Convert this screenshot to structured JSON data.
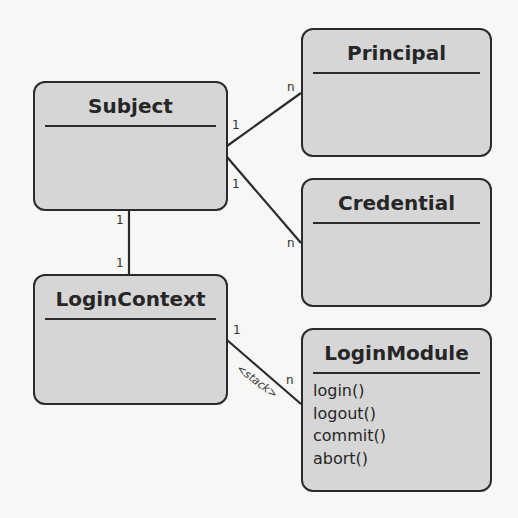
{
  "diagram": {
    "type": "UML class diagram",
    "classes": [
      {
        "id": "subject",
        "name": "Subject",
        "methods": []
      },
      {
        "id": "principal",
        "name": "Principal",
        "methods": []
      },
      {
        "id": "credential",
        "name": "Credential",
        "methods": []
      },
      {
        "id": "login_context",
        "name": "LoginContext",
        "methods": []
      },
      {
        "id": "login_module",
        "name": "LoginModule",
        "methods": [
          "login()",
          "logout()",
          "commit()",
          "abort()"
        ]
      }
    ],
    "associations": [
      {
        "from": "Subject",
        "to": "Principal",
        "from_mult": "1",
        "to_mult": "n"
      },
      {
        "from": "Subject",
        "to": "Credential",
        "from_mult": "1",
        "to_mult": "n"
      },
      {
        "from": "Subject",
        "to": "LoginContext",
        "from_mult": "1",
        "to_mult": "1"
      },
      {
        "from": "LoginContext",
        "to": "LoginModule",
        "from_mult": "1",
        "to_mult": "n",
        "label": "<stack>"
      }
    ]
  },
  "labels": {
    "subject": "Subject",
    "principal": "Principal",
    "credential": "Credential",
    "login_context": "LoginContext",
    "login_module": "LoginModule",
    "m_login": "login()",
    "m_logout": "logout()",
    "m_commit": "commit()",
    "m_abort": "abort()",
    "one": "1",
    "many": "n",
    "stack": "<stack>"
  },
  "colors": {
    "box_fill": "#d6d6d6",
    "stroke": "#2b2b2b",
    "background": "#f7f7f5"
  }
}
